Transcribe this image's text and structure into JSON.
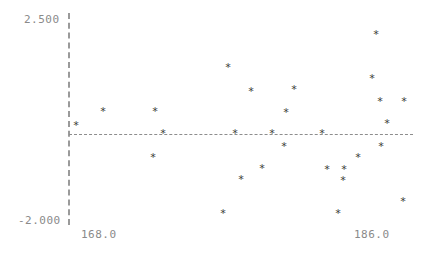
{
  "axes": {
    "y_max_label": "2.500",
    "y_min_label": "-2.000",
    "x_min_label": "168.0",
    "x_max_label": "186.0",
    "marker_glyph": "*",
    "axis_color": "#9a9a9a",
    "label_color": "#8a8a8a",
    "marker_color": "#3a3a3a",
    "background": "#ffffff"
  },
  "chart_data": {
    "type": "scatter",
    "title": "",
    "subtitle": "",
    "xlabel": "",
    "ylabel": "",
    "xlim": [
      168.0,
      186.0
    ],
    "ylim": [
      -2.0,
      2.5
    ],
    "xticks": [
      168.0,
      186.0
    ],
    "yticks": [
      -2.0,
      2.5
    ],
    "xticklabels": [
      "168.0",
      "186.0"
    ],
    "yticklabels": [
      "-2.000",
      "2.500"
    ],
    "grid": false,
    "legend": null,
    "annotations": [
      {
        "type": "hline",
        "y": 0.0,
        "style": "dashed",
        "label": ""
      },
      {
        "type": "vline",
        "x": 168.0,
        "style": "dashed",
        "label": ""
      }
    ],
    "marker": "star",
    "series": [
      {
        "name": "residuals",
        "points": [
          {
            "x": 168.0,
            "y": 0.22,
            "px": 76,
            "py": 126
          },
          {
            "x": 169.4,
            "y": 0.52,
            "px": 103,
            "py": 112
          },
          {
            "x": 171.3,
            "y": -0.5,
            "px": 153,
            "py": 158
          },
          {
            "x": 171.4,
            "y": 0.52,
            "px": 155,
            "py": 112
          },
          {
            "x": 171.8,
            "y": 0.0,
            "px": 163,
            "py": 134
          },
          {
            "x": 175.0,
            "y": -1.72,
            "px": 223,
            "py": 214
          },
          {
            "x": 175.6,
            "y": 1.5,
            "px": 228,
            "py": 68
          },
          {
            "x": 176.0,
            "y": 0.0,
            "px": 235,
            "py": 134
          },
          {
            "x": 176.3,
            "y": -1.02,
            "px": 241,
            "py": 180
          },
          {
            "x": 176.8,
            "y": 0.98,
            "px": 251,
            "py": 92
          },
          {
            "x": 177.4,
            "y": -0.75,
            "px": 262,
            "py": 169
          },
          {
            "x": 177.9,
            "y": 0.0,
            "px": 272,
            "py": 134
          },
          {
            "x": 178.5,
            "y": 1.05,
            "px": 286,
            "py": 113
          },
          {
            "x": 178.4,
            "y": -0.28,
            "px": 284,
            "py": 147
          },
          {
            "x": 178.9,
            "y": 1.0,
            "px": 294,
            "py": 90
          },
          {
            "x": 180.4,
            "y": 0.0,
            "px": 322,
            "py": 134
          },
          {
            "x": 180.7,
            "y": -0.8,
            "px": 327,
            "py": 170
          },
          {
            "x": 181.4,
            "y": -0.8,
            "px": 344,
            "py": 170
          },
          {
            "x": 181.3,
            "y": -1.05,
            "px": 343,
            "py": 181
          },
          {
            "x": 181.1,
            "y": -1.75,
            "px": 338,
            "py": 214
          },
          {
            "x": 182.1,
            "y": -0.52,
            "px": 358,
            "py": 158
          },
          {
            "x": 182.8,
            "y": 1.28,
            "px": 372,
            "py": 79
          },
          {
            "x": 183.0,
            "y": 2.22,
            "px": 376,
            "py": 35
          },
          {
            "x": 183.2,
            "y": 0.72,
            "px": 380,
            "py": 102
          },
          {
            "x": 183.2,
            "y": -0.3,
            "px": 381,
            "py": 147
          },
          {
            "x": 183.5,
            "y": 0.25,
            "px": 387,
            "py": 124
          },
          {
            "x": 184.4,
            "y": -1.55,
            "px": 403,
            "py": 202
          },
          {
            "x": 184.5,
            "y": 0.72,
            "px": 404,
            "py": 102
          }
        ]
      }
    ]
  }
}
